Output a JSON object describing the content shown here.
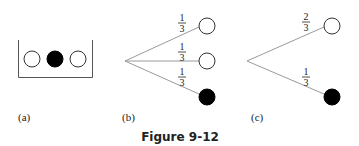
{
  "figure": {
    "caption": "Figure 9-12",
    "colors": {
      "line": "#9a9a9a",
      "stroke": "#333333",
      "filled": "#000000",
      "empty": "#ffffff"
    }
  },
  "panels": [
    {
      "label": "(a)",
      "description": "urn with three balls",
      "balls": [
        "white",
        "black",
        "white"
      ]
    },
    {
      "label": "(b)",
      "description": "tree with three equally likely branches",
      "branches": [
        {
          "num": "1",
          "den": "3",
          "outcome": "white"
        },
        {
          "num": "1",
          "den": "3",
          "outcome": "white"
        },
        {
          "num": "1",
          "den": "3",
          "outcome": "black"
        }
      ]
    },
    {
      "label": "(c)",
      "description": "collapsed tree with two branches",
      "branches": [
        {
          "num": "2",
          "den": "3",
          "outcome": "white"
        },
        {
          "num": "1",
          "den": "3",
          "outcome": "black"
        }
      ]
    }
  ]
}
